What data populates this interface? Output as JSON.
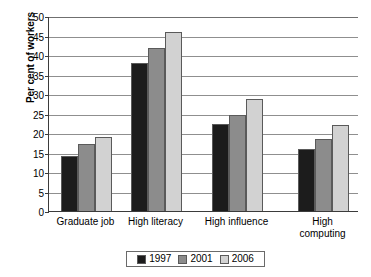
{
  "chart_data": {
    "type": "bar",
    "title": "",
    "xlabel": "",
    "ylabel": "Per cent of workers",
    "ylim": [
      0,
      50
    ],
    "ytick_step": 5,
    "yticks": [
      0,
      5,
      10,
      15,
      20,
      25,
      30,
      35,
      40,
      45,
      50
    ],
    "grid": true,
    "legend_position": "bottom",
    "categories": [
      "Graduate job",
      "High literacy",
      "High influence",
      "High\ncomputing"
    ],
    "series": [
      {
        "name": "1997",
        "color": "#1c1c1c",
        "values": [
          14.0,
          38.0,
          22.4,
          15.8
        ]
      },
      {
        "name": "2001",
        "color": "#8c8c8c",
        "values": [
          17.2,
          41.8,
          24.6,
          18.4
        ]
      },
      {
        "name": "2006",
        "color": "#d2d2d2",
        "values": [
          18.9,
          46.0,
          28.6,
          22.0
        ]
      }
    ]
  },
  "legend": {
    "items": [
      {
        "label": "1997",
        "color": "#1c1c1c"
      },
      {
        "label": "2001",
        "color": "#8c8c8c"
      },
      {
        "label": "2006",
        "color": "#d2d2d2"
      }
    ]
  },
  "axis": {
    "y_title": "Per cent of workers"
  },
  "colors": {
    "series_1997": "#1c1c1c",
    "series_2001": "#8c8c8c",
    "series_2006": "#d2d2d2",
    "axis_line": "#3b3b3b",
    "gridline": "#8f8f8f",
    "background": "#ffffff",
    "text": "#000000"
  }
}
